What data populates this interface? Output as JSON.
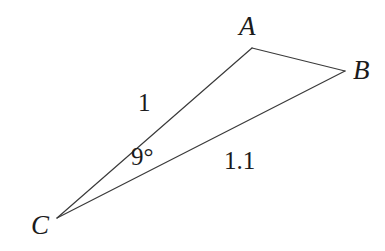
{
  "figure": {
    "type": "geometry-diagram",
    "shape": "triangle",
    "background_color": "#ffffff",
    "stroke_color": "#3a3a3a",
    "stroke_width": 1.2,
    "text_color": "#1b1b1b",
    "width": 385,
    "height": 251
  },
  "vertices": {
    "A": {
      "label": "A",
      "x": 252,
      "y": 48
    },
    "B": {
      "label": "B",
      "x": 345,
      "y": 71
    },
    "C": {
      "label": "C",
      "x": 57,
      "y": 218
    }
  },
  "edges": [
    {
      "name": "CA",
      "from": "C",
      "to": "A",
      "length_label": "1"
    },
    {
      "name": "CB",
      "from": "C",
      "to": "B",
      "length_label": "1.1"
    },
    {
      "name": "AB",
      "from": "A",
      "to": "B",
      "length_label": ""
    }
  ],
  "labels": {
    "vertex_a": "A",
    "vertex_b": "B",
    "vertex_c": "C",
    "side_ca": "1",
    "side_cb": "1.1",
    "angle_c": "9°"
  },
  "measurements": {
    "side_ca_length": 1,
    "side_cb_length": 1.1,
    "angle_at_c_degrees": 9,
    "angle_unit": "°"
  },
  "geometry_paths": {
    "edge_ca": "M 57 218 L 252 48",
    "edge_ab": "M 252 48 L 345 71",
    "edge_cb": "M 57 218 L 345 71"
  }
}
